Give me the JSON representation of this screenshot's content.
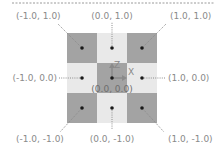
{
  "diagram": {
    "title": "",
    "colors": {
      "dark_cell": "#a3a3a3",
      "light_cell": "#e9e9e9",
      "dot": "#1a1a1a",
      "leader": "#8c8c8c",
      "label": "#8a8a8a",
      "axis_arrow": "#8a8a8a",
      "top_dashed_line": "#9a9a9a"
    },
    "grid": {
      "rows": 3,
      "cols": 3,
      "pattern": "checkerboard",
      "corners_and_center": "dark",
      "edges": "light"
    },
    "axes": {
      "z_label": "Z",
      "x_label": "X"
    },
    "points": [
      {
        "id": "nw",
        "label": "(-1.0, 1.0)"
      },
      {
        "id": "n",
        "label": "(0.0, 1.0)"
      },
      {
        "id": "ne",
        "label": "(1.0, 1.0)"
      },
      {
        "id": "w",
        "label": "(-1.0, 0.0)"
      },
      {
        "id": "c",
        "label": "(0.0, 0.0)"
      },
      {
        "id": "e",
        "label": "(1.0, 0.0)"
      },
      {
        "id": "sw",
        "label": "(-1.0, -1.0)"
      },
      {
        "id": "s",
        "label": "(0.0, -1.0)"
      },
      {
        "id": "se",
        "label": "(1.0, -1.0)"
      }
    ]
  }
}
